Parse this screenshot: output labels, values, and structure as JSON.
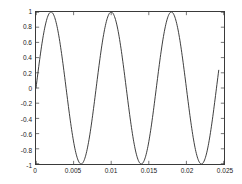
{
  "figure": {
    "title": "",
    "background_color": "#ffffff"
  },
  "axes": {
    "frame_color": "#3a3a3a",
    "tick_color": "#3a3a3a",
    "label_color": "#1a1a1a",
    "x_ticks": [
      "0",
      "0.005",
      "0.01",
      "0.015",
      "0.02",
      "0.025"
    ],
    "x_tick_values": [
      0,
      0.005,
      0.01,
      0.015,
      0.02,
      0.025
    ],
    "y_ticks": [
      "-1",
      "-0.8",
      "-0.6",
      "-0.4",
      "-0.2",
      "0",
      "0.2",
      "0.4",
      "0.6",
      "0.8",
      "1"
    ],
    "y_tick_values": [
      -1,
      -0.8,
      -0.6,
      -0.4,
      -0.2,
      0,
      0.2,
      0.4,
      0.6,
      0.8,
      1
    ]
  },
  "chart_data": {
    "type": "line",
    "title": "",
    "xlabel": "",
    "ylabel": "",
    "xlim": [
      0,
      0.025
    ],
    "ylim": [
      -1,
      1
    ],
    "grid": false,
    "legend": null,
    "series": [
      {
        "name": "sine",
        "color": "#262626",
        "line_width": 0.9,
        "waveform": "sine",
        "amplitude": 1,
        "frequency_hz": 125,
        "period_s": 0.008,
        "phase_rad": 0,
        "x_start": 0,
        "x_end": 0.0243,
        "sample_count": 400,
        "peaks_x": [
          0.002,
          0.01,
          0.018
        ],
        "peaks_y": [
          1,
          1,
          1
        ],
        "troughs_x": [
          0.006,
          0.014,
          0.022
        ],
        "troughs_y": [
          -1,
          -1,
          -1
        ],
        "zero_crossings_x": [
          0,
          0.004,
          0.008,
          0.012,
          0.016,
          0.02,
          0.024
        ],
        "end_value_y": 0.63
      }
    ]
  }
}
